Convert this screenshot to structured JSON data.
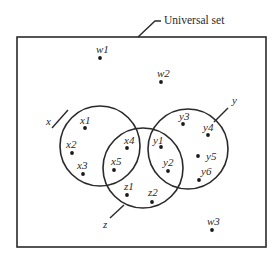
{
  "diagram": {
    "type": "venn",
    "universal_set": {
      "label": "Universal set",
      "rect": {
        "x": 17,
        "y": 37,
        "w": 249,
        "h": 210
      },
      "leader": [
        [
          138,
          37
        ],
        [
          155,
          21
        ],
        [
          161,
          21
        ]
      ],
      "label_pos": [
        164,
        24
      ]
    },
    "sets": [
      {
        "name": "x",
        "label": "x",
        "cx": 100,
        "cy": 146,
        "r": 40,
        "label_pos": [
          46,
          125
        ],
        "leader": [
          [
            52,
            128
          ],
          [
            68,
            110
          ]
        ]
      },
      {
        "name": "y",
        "label": "y",
        "cx": 188,
        "cy": 149,
        "r": 40,
        "label_pos": [
          232,
          104
        ],
        "leader": [
          [
            228,
            108
          ],
          [
            214,
            122
          ]
        ]
      },
      {
        "name": "z",
        "label": "z",
        "cx": 143,
        "cy": 168,
        "r": 40,
        "label_pos": [
          103,
          228
        ],
        "leader": [
          [
            110,
            218
          ],
          [
            124,
            205
          ]
        ]
      }
    ],
    "elements": [
      {
        "label": "w1",
        "region": "outside",
        "dot": [
          100,
          58
        ],
        "text": [
          96,
          53
        ]
      },
      {
        "label": "w2",
        "region": "outside",
        "dot": [
          161,
          82
        ],
        "text": [
          157,
          77
        ]
      },
      {
        "label": "w3",
        "region": "outside",
        "dot": [
          212,
          230
        ],
        "text": [
          207,
          225
        ]
      },
      {
        "label": "x1",
        "region": "x",
        "dot": [
          85,
          128
        ],
        "text": [
          80,
          124
        ]
      },
      {
        "label": "x2",
        "region": "x",
        "dot": [
          72,
          153
        ],
        "text": [
          66,
          148
        ]
      },
      {
        "label": "x3",
        "region": "x",
        "dot": [
          83,
          174
        ],
        "text": [
          77,
          169
        ]
      },
      {
        "label": "x4",
        "region": "x∩z",
        "dot": [
          127,
          148
        ],
        "text": [
          124,
          144
        ]
      },
      {
        "label": "x5",
        "region": "x∩z",
        "dot": [
          114,
          170
        ],
        "text": [
          111,
          165
        ]
      },
      {
        "label": "y1",
        "region": "y∩z",
        "dot": [
          161,
          147
        ],
        "text": [
          153,
          144
        ]
      },
      {
        "label": "y2",
        "region": "y∩z",
        "dot": [
          168,
          171
        ],
        "text": [
          163,
          166
        ]
      },
      {
        "label": "y3",
        "region": "y",
        "dot": [
          183,
          124
        ],
        "text": [
          179,
          120
        ]
      },
      {
        "label": "y4",
        "region": "y",
        "dot": [
          208,
          135
        ],
        "text": [
          203,
          131
        ]
      },
      {
        "label": "y5",
        "region": "y",
        "dot": [
          198,
          156
        ],
        "text": [
          206,
          160
        ]
      },
      {
        "label": "y6",
        "region": "y",
        "dot": [
          199,
          180
        ],
        "text": [
          201,
          175
        ]
      },
      {
        "label": "z1",
        "region": "z",
        "dot": [
          127,
          195
        ],
        "text": [
          124,
          190
        ]
      },
      {
        "label": "z2",
        "region": "z",
        "dot": [
          152,
          202
        ],
        "text": [
          148,
          196
        ]
      }
    ]
  },
  "colors": {
    "line": "#2a2a2a",
    "dot": "#1a1a1a",
    "background": "#ffffff"
  }
}
